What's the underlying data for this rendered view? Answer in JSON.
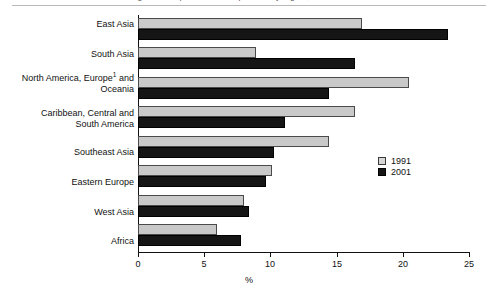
{
  "figure": {
    "top_caption_fragment": "Figure 3. Proportion of older persons by region, 1991 and 2001",
    "axis_title": "%",
    "legend_position": "inside-right"
  },
  "chart_data": {
    "type": "bar",
    "orientation": "horizontal",
    "title": "",
    "xlabel": "%",
    "ylabel": "",
    "xlim": [
      0,
      25
    ],
    "xticks": [
      0,
      5,
      10,
      15,
      20,
      25
    ],
    "xtick_labels": [
      "0",
      "5",
      "10",
      "15",
      "20",
      "25"
    ],
    "grid": false,
    "categories": [
      "East Asia",
      "South Asia",
      "North America, Europe¹ and Oceania",
      "Caribbean, Central and South America",
      "Southeast Asia",
      "Eastern Europe",
      "West Asia",
      "Africa"
    ],
    "series": [
      {
        "name": "1991",
        "color": "#c9c9c9",
        "values": [
          16.9,
          8.9,
          20.5,
          16.4,
          14.4,
          10.1,
          8.0,
          6.0
        ]
      },
      {
        "name": "2001",
        "color": "#151515",
        "values": [
          23.4,
          16.4,
          14.4,
          11.1,
          10.3,
          9.7,
          8.4,
          7.8
        ]
      }
    ],
    "legend": [
      "1991",
      "2001"
    ]
  },
  "labels": {
    "cat_0": "East Asia",
    "cat_1": "South Asia",
    "cat_2a": "North America, Europe",
    "cat_2sup": "1",
    "cat_2b": " and",
    "cat_2c": "Oceania",
    "cat_3a": "Caribbean, Central and",
    "cat_3b": "South America",
    "cat_4": "Southeast Asia",
    "cat_5": "Eastern Europe",
    "cat_6": "West Asia",
    "cat_7": "Africa"
  },
  "ticks": {
    "t0": "0",
    "t1": "5",
    "t2": "10",
    "t3": "15",
    "t4": "20",
    "t5": "25"
  },
  "legend": {
    "item_1991": "1991",
    "item_2001": "2001"
  }
}
